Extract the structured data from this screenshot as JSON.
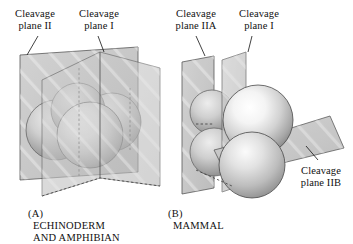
{
  "figure": {
    "background_color": "#ffffff",
    "plane_fill": "#c8c8c8",
    "plane_stroke": "#4a4a4a",
    "sphere_highlight": "#ffffff",
    "sphere_shadow": "#8d8d8d",
    "streak_color": "#f2f2f2"
  },
  "panels": [
    {
      "id": "A",
      "panel_id_text": "(A)",
      "caption": "ECHINODERM\nAND AMPHIBIAN",
      "cleavage_type": "radial holoblastic",
      "blastomere_count": 4,
      "labels": [
        {
          "text": "Cleavage\nplane II",
          "name": "cleavage-plane-2"
        },
        {
          "text": "Cleavage\nplane I",
          "name": "cleavage-plane-1"
        }
      ],
      "planes": [
        {
          "name": "plane-II",
          "orientation": "vertical"
        },
        {
          "name": "plane-I",
          "orientation": "vertical"
        }
      ]
    },
    {
      "id": "B",
      "panel_id_text": "(B)",
      "caption": "MAMMAL",
      "cleavage_type": "rotational holoblastic",
      "blastomere_count": 4,
      "labels": [
        {
          "text": "Cleavage\nplane IIA",
          "name": "cleavage-plane-2a"
        },
        {
          "text": "Cleavage\nplane I",
          "name": "cleavage-plane-1"
        },
        {
          "text": "Cleavage\nplane IIB",
          "name": "cleavage-plane-2b"
        }
      ],
      "planes": [
        {
          "name": "plane-IIA",
          "orientation": "vertical"
        },
        {
          "name": "plane-I",
          "orientation": "vertical"
        },
        {
          "name": "plane-IIB",
          "orientation": "horizontal"
        }
      ]
    }
  ]
}
